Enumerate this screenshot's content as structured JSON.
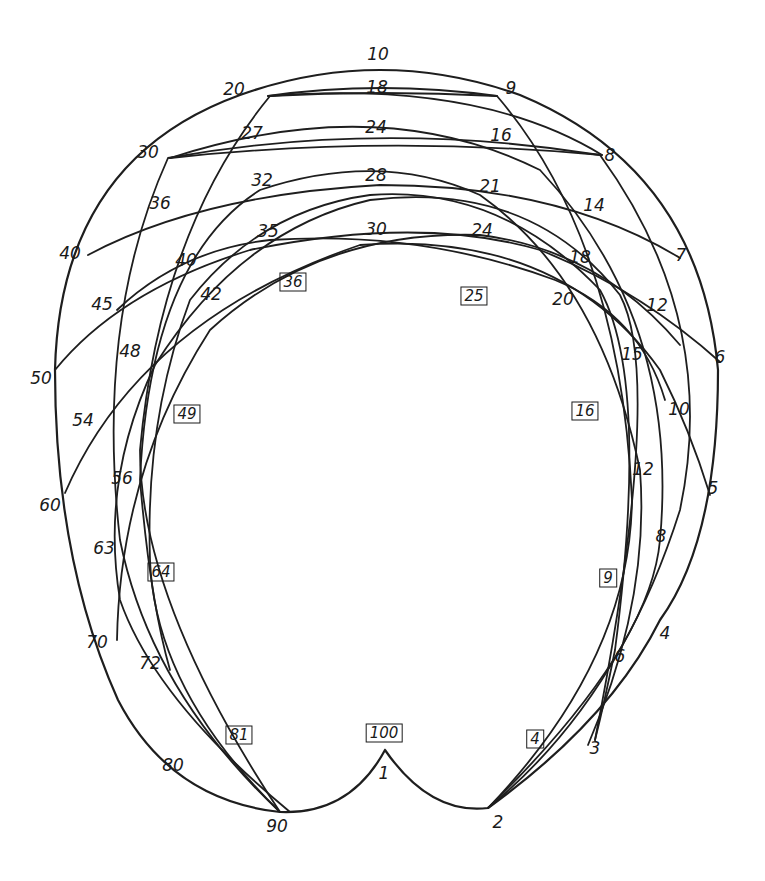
{
  "diagram": {
    "type": "hand-drawn multiplication arc diagram",
    "background": "#ffffff",
    "stroke_color": "#1e1e1e",
    "outer_labels": [
      {
        "text": "10",
        "x": 378,
        "y": 54
      },
      {
        "text": "9",
        "x": 511,
        "y": 88
      },
      {
        "text": "8",
        "x": 610,
        "y": 155
      },
      {
        "text": "7",
        "x": 681,
        "y": 255
      },
      {
        "text": "6",
        "x": 720,
        "y": 357
      },
      {
        "text": "5",
        "x": 713,
        "y": 488
      },
      {
        "text": "4",
        "x": 665,
        "y": 633
      },
      {
        "text": "3",
        "x": 595,
        "y": 748
      },
      {
        "text": "2",
        "x": 498,
        "y": 822
      },
      {
        "text": "1",
        "x": 384,
        "y": 773
      },
      {
        "text": "90",
        "x": 277,
        "y": 826
      },
      {
        "text": "80",
        "x": 173,
        "y": 765
      },
      {
        "text": "70",
        "x": 97,
        "y": 642
      },
      {
        "text": "60",
        "x": 50,
        "y": 505
      },
      {
        "text": "50",
        "x": 41,
        "y": 378
      },
      {
        "text": "40",
        "x": 70,
        "y": 253
      },
      {
        "text": "30",
        "x": 148,
        "y": 152
      },
      {
        "text": "20",
        "x": 234,
        "y": 89
      }
    ],
    "intersection_labels": [
      {
        "text": "18",
        "x": 377,
        "y": 87
      },
      {
        "text": "27",
        "x": 252,
        "y": 133
      },
      {
        "text": "24",
        "x": 376,
        "y": 127
      },
      {
        "text": "16",
        "x": 501,
        "y": 135
      },
      {
        "text": "36",
        "x": 160,
        "y": 203
      },
      {
        "text": "32",
        "x": 262,
        "y": 180
      },
      {
        "text": "28",
        "x": 376,
        "y": 175
      },
      {
        "text": "21",
        "x": 490,
        "y": 186
      },
      {
        "text": "14",
        "x": 594,
        "y": 205
      },
      {
        "text": "40",
        "x": 186,
        "y": 260
      },
      {
        "text": "35",
        "x": 268,
        "y": 231
      },
      {
        "text": "30",
        "x": 376,
        "y": 229
      },
      {
        "text": "24",
        "x": 482,
        "y": 230
      },
      {
        "text": "18",
        "x": 580,
        "y": 257
      },
      {
        "text": "45",
        "x": 102,
        "y": 304
      },
      {
        "text": "42",
        "x": 211,
        "y": 294
      },
      {
        "text": "20",
        "x": 563,
        "y": 299
      },
      {
        "text": "12",
        "x": 657,
        "y": 305
      },
      {
        "text": "48",
        "x": 130,
        "y": 351
      },
      {
        "text": "15",
        "x": 632,
        "y": 354
      },
      {
        "text": "54",
        "x": 83,
        "y": 420
      },
      {
        "text": "10",
        "x": 679,
        "y": 409
      },
      {
        "text": "56",
        "x": 122,
        "y": 478
      },
      {
        "text": "12",
        "x": 643,
        "y": 469
      },
      {
        "text": "63",
        "x": 104,
        "y": 548
      },
      {
        "text": "8",
        "x": 661,
        "y": 536
      },
      {
        "text": "72",
        "x": 150,
        "y": 663
      },
      {
        "text": "6",
        "x": 620,
        "y": 656
      }
    ],
    "square_labels": [
      {
        "text": "36",
        "x": 293,
        "y": 282
      },
      {
        "text": "25",
        "x": 474,
        "y": 296
      },
      {
        "text": "49",
        "x": 187,
        "y": 414
      },
      {
        "text": "16",
        "x": 585,
        "y": 411
      },
      {
        "text": "64",
        "x": 161,
        "y": 572
      },
      {
        "text": "9",
        "x": 608,
        "y": 578
      },
      {
        "text": "81",
        "x": 239,
        "y": 735
      },
      {
        "text": "100",
        "x": 384,
        "y": 733
      },
      {
        "text": "4",
        "x": 535,
        "y": 739
      }
    ],
    "curves": [
      "M 385 750 Q 350 815 280 812 Q 170 800 118 700 Q 55 560 55 370 Q 60 160 240 95 Q 380 45 520 95 Q 700 170 718 370 Q 718 540 660 620 Q 610 720 488 808 Q 430 815 385 750",
      "M 280 812 Q 150 690 120 540 Q 95 320 168 158 Q 380 120 600 155 Q 720 320 680 510 Q 620 700 488 808",
      "M 280 812 Q 140 600 140 450 Q 160 230 270 96 Q 480 80 602 155",
      "M 170 158 Q 380 135 602 155",
      "M 268 96 Q 380 90 497 96",
      "M 488 808 Q 630 660 632 500 Q 620 240 497 96 Q 380 80 268 96",
      "M 488 808 Q 650 650 660 540 Q 680 320 540 170 Q 380 90 170 158",
      "M 588 745 Q 650 600 640 470 Q 600 280 480 195 Q 380 150 260 190 Q 150 260 140 480 Q 150 600 170 670",
      "M 117 640 Q 120 470 210 330 Q 320 230 480 235 Q 600 250 680 345",
      "M 65 493 Q 140 320 360 245 Q 560 230 660 370 Q 690 430 710 495",
      "M 55 370 Q 120 290 250 250 Q 420 215 540 250 Q 640 290 720 362",
      "M 88 255 Q 200 195 380 185 Q 560 185 680 258",
      "M 117 310 Q 180 250 270 240 Q 420 230 555 280 Q 640 315 665 400",
      "M 290 812 Q 155 700 120 600 Q 100 480 155 365 Q 240 230 370 200 Q 530 180 620 295 Q 665 380 595 740",
      "M 280 812 Q 155 690 150 560 Q 145 420 190 300 Q 260 210 370 195 Q 500 185 600 290 Q 650 380 615 650 Q 605 700 595 740"
    ]
  }
}
